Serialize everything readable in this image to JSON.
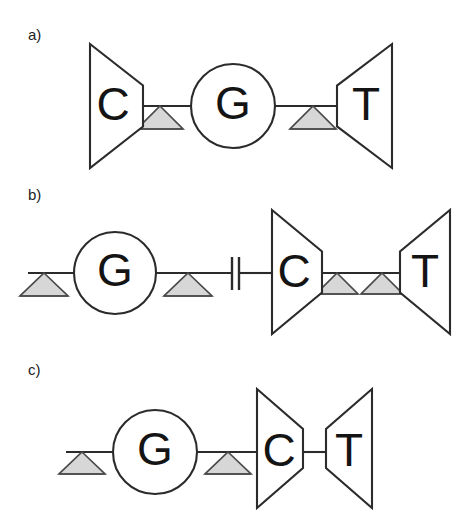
{
  "figure": {
    "background_color": "#ffffff",
    "stroke_color": "#2b2b2b",
    "letter_color": "#141414",
    "triangle_fill": "#d7d7d7",
    "triangle_stroke": "#4a4a4a",
    "width": 463,
    "height": 524
  },
  "panels": [
    {
      "id": "a",
      "label": "a)",
      "label_x": 28,
      "label_y": 40,
      "baseline_y": 106,
      "nodes": [
        {
          "name": "gene-c",
          "letter": "C",
          "shape": "trapezoid-right",
          "x_left": 90,
          "x_right": 143,
          "y_top": 44,
          "y_bottom": 168,
          "letter_x": 113,
          "letter_y": 108
        },
        {
          "name": "gene-g",
          "letter": "G",
          "shape": "circle",
          "cx": 233,
          "cy": 106,
          "r": 42,
          "letter_x": 233,
          "letter_y": 107
        },
        {
          "name": "gene-t",
          "letter": "T",
          "shape": "trapezoid-left",
          "x_left": 337,
          "x_right": 392,
          "y_top": 44,
          "y_bottom": 168,
          "letter_x": 366,
          "letter_y": 108
        }
      ],
      "connectors": [
        {
          "name": "link-c-to-g",
          "x1": 143,
          "x2": 191,
          "y": 106
        },
        {
          "name": "link-g-to-t",
          "x1": 275,
          "x2": 337,
          "y": 106
        }
      ],
      "triangles": [
        {
          "name": "marker-1",
          "cx": 160,
          "y_top": 106,
          "y_bottom": 129,
          "half_width": 23
        },
        {
          "name": "marker-2",
          "cx": 313,
          "y_top": 106,
          "y_bottom": 129,
          "half_width": 23
        }
      ],
      "breaks": []
    },
    {
      "id": "b",
      "label": "b)",
      "label_x": 28,
      "label_y": 200,
      "baseline_y": 273,
      "nodes": [
        {
          "name": "gene-g",
          "letter": "G",
          "shape": "circle",
          "cx": 115,
          "cy": 273,
          "r": 41,
          "letter_x": 115,
          "letter_y": 274
        },
        {
          "name": "gene-c",
          "letter": "C",
          "shape": "trapezoid-right",
          "x_left": 272,
          "x_right": 322,
          "y_top": 210,
          "y_bottom": 334,
          "letter_x": 294,
          "letter_y": 275
        },
        {
          "name": "gene-t",
          "letter": "T",
          "shape": "trapezoid-left",
          "x_left": 400,
          "x_right": 450,
          "y_top": 210,
          "y_bottom": 334,
          "letter_x": 425,
          "letter_y": 275
        }
      ],
      "connectors": [
        {
          "name": "link-start-to-g",
          "x1": 28,
          "x2": 74,
          "y": 273
        },
        {
          "name": "link-g-to-break",
          "x1": 156,
          "x2": 232,
          "y": 273
        },
        {
          "name": "link-break-to-c",
          "x1": 240,
          "x2": 272,
          "y": 273
        },
        {
          "name": "link-c-to-t",
          "x1": 322,
          "x2": 400,
          "y": 273
        }
      ],
      "triangles": [
        {
          "name": "marker-1",
          "cx": 44,
          "y_top": 273,
          "y_bottom": 296,
          "half_width": 24
        },
        {
          "name": "marker-2",
          "cx": 188,
          "y_top": 273,
          "y_bottom": 296,
          "half_width": 24
        },
        {
          "name": "marker-3",
          "cx": 337,
          "y_top": 273,
          "y_bottom": 294,
          "half_width": 21
        },
        {
          "name": "marker-4",
          "cx": 382,
          "y_top": 273,
          "y_bottom": 294,
          "half_width": 21
        }
      ],
      "breaks": [
        {
          "name": "sequence-break",
          "x1": 232,
          "x2": 239,
          "y_top": 257,
          "y_bottom": 290
        }
      ]
    },
    {
      "id": "c",
      "label": "c)",
      "label_x": 28,
      "label_y": 375,
      "baseline_y": 452,
      "nodes": [
        {
          "name": "gene-g",
          "letter": "G",
          "shape": "circle",
          "cx": 155,
          "cy": 452,
          "r": 42,
          "letter_x": 155,
          "letter_y": 453
        },
        {
          "name": "gene-c",
          "letter": "C",
          "shape": "trapezoid-right",
          "x_left": 257,
          "x_right": 303,
          "y_top": 389,
          "y_bottom": 508,
          "letter_x": 279,
          "letter_y": 454
        },
        {
          "name": "gene-t",
          "letter": "T",
          "shape": "trapezoid-left",
          "x_left": 326,
          "x_right": 372,
          "y_top": 389,
          "y_bottom": 508,
          "letter_x": 349,
          "letter_y": 454
        }
      ],
      "connectors": [
        {
          "name": "link-start-to-g",
          "x1": 66,
          "x2": 113,
          "y": 452
        },
        {
          "name": "link-g-to-c",
          "x1": 197,
          "x2": 257,
          "y": 452
        },
        {
          "name": "link-c-to-t",
          "x1": 303,
          "x2": 326,
          "y": 452
        }
      ],
      "triangles": [
        {
          "name": "marker-1",
          "cx": 82,
          "y_top": 452,
          "y_bottom": 474,
          "half_width": 23
        },
        {
          "name": "marker-2",
          "cx": 228,
          "y_top": 452,
          "y_bottom": 474,
          "half_width": 23
        }
      ],
      "breaks": []
    }
  ]
}
